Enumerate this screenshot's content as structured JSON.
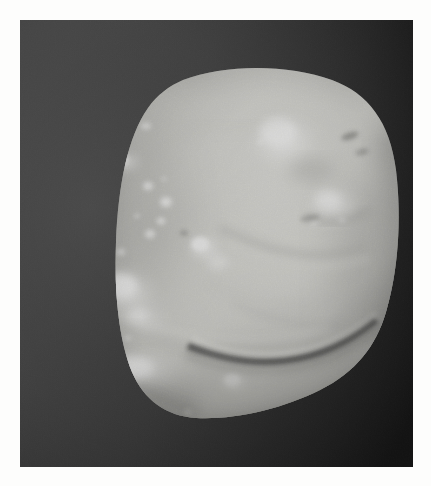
{
  "page": {
    "type": "photographic-plate",
    "paper_color": "#fdfdfc",
    "plate_width": 431,
    "plate_height": 486
  },
  "photo": {
    "name": "irregular-moon-photograph",
    "description": "Grayscale spacecraft photograph of an irregularly shaped small solar system body",
    "frame": {
      "x": 20,
      "y": 20,
      "width": 393,
      "height": 447
    },
    "background": {
      "label": "space-background",
      "color_left": "#3f3f3f",
      "color_mid": "#2a2a2a",
      "color_right": "#0c0c0c",
      "grain": "film-grain"
    },
    "body": {
      "label": "moon-body",
      "silhouette": "M 163 60 C 205 44, 268 44, 312 60 C 348 73, 370 102, 376 150 C 382 200, 378 252, 366 292 C 356 326, 336 352, 300 370 C 262 389, 214 400, 176 398 C 146 396, 124 380, 112 352 C 99 320, 94 274, 96 222 C 98 166, 108 116, 128 88 C 137 75, 149 66, 163 60 Z",
      "surface_base": "#b9b9b5",
      "highlight_color": "#f2f2ee",
      "shadow_color": "#6d6d6a",
      "terminator": "lower-left-limb",
      "illumination": "upper-right"
    },
    "features": [
      {
        "name": "bright-crater-rim-upper-left",
        "cx": 104,
        "cy": 142,
        "rx": 17,
        "ry": 11,
        "brightness": 0.85
      },
      {
        "name": "bright-crater-rim-top-left",
        "cx": 126,
        "cy": 106,
        "rx": 9,
        "ry": 7,
        "brightness": 0.7
      },
      {
        "name": "crater-chain-spot-1",
        "cx": 128,
        "cy": 166,
        "rx": 7,
        "ry": 6,
        "brightness": 0.9
      },
      {
        "name": "crater-chain-spot-2",
        "cx": 146,
        "cy": 182,
        "rx": 8,
        "ry": 7,
        "brightness": 0.95
      },
      {
        "name": "crater-chain-spot-3",
        "cx": 142,
        "cy": 202,
        "rx": 6,
        "ry": 5,
        "brightness": 0.8
      },
      {
        "name": "crater-chain-spot-4",
        "cx": 130,
        "cy": 214,
        "rx": 7,
        "ry": 6,
        "brightness": 0.85
      },
      {
        "name": "central-bright-knob",
        "cx": 182,
        "cy": 228,
        "rx": 16,
        "ry": 13,
        "brightness": 0.9
      },
      {
        "name": "main-highlight-upper-right",
        "cx": 264,
        "cy": 122,
        "rx": 32,
        "ry": 24,
        "brightness": 1.0
      },
      {
        "name": "secondary-highlight-right",
        "cx": 312,
        "cy": 186,
        "rx": 26,
        "ry": 17,
        "brightness": 0.92
      },
      {
        "name": "small-dark-pit-right",
        "cx": 330,
        "cy": 116,
        "rx": 9,
        "ry": 4,
        "brightness": 0.25
      },
      {
        "name": "big-crater-left-lower",
        "cx": 106,
        "cy": 272,
        "rx": 30,
        "ry": 22,
        "brightness": 0.95
      },
      {
        "name": "rim-bright-left-lower",
        "cx": 122,
        "cy": 300,
        "rx": 22,
        "ry": 14,
        "brightness": 0.8
      },
      {
        "name": "bright-band-lower-left",
        "cx": 120,
        "cy": 352,
        "rx": 40,
        "ry": 18,
        "brightness": 0.9
      },
      {
        "name": "bright-spot-lower-center",
        "cx": 212,
        "cy": 362,
        "rx": 14,
        "ry": 10,
        "brightness": 0.85
      },
      {
        "name": "groove-arc-lower-right",
        "path": "M 176 322 C 236 342, 300 338, 352 300",
        "brightness": 0.1
      },
      {
        "name": "ridge-lower-center",
        "path": "M 96 310 C 160 332, 240 340, 306 318",
        "brightness": 0.55
      },
      {
        "name": "ridge-mid-right",
        "path": "M 200 210 C 252 236, 300 244, 346 228",
        "brightness": 0.5
      },
      {
        "name": "ridge-lower-left-diagonal",
        "path": "M 104 360 C 150 392, 200 404, 250 390",
        "brightness": 0.5
      }
    ],
    "tonal_range": {
      "darkest": "#060606",
      "background_gray": "#3a3a3a",
      "body_mid": "#bdbdb8",
      "brightest": "#f6f6f2"
    }
  }
}
